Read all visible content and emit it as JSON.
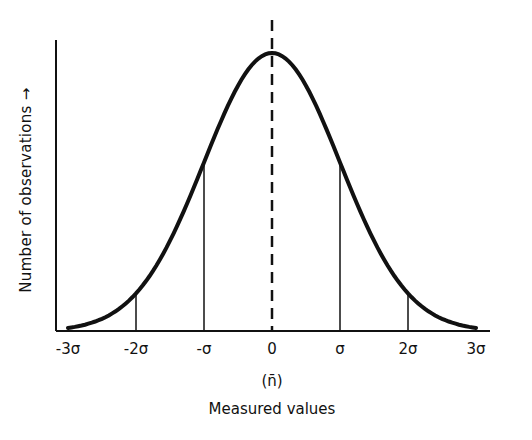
{
  "chart_data": {
    "type": "line",
    "title": "",
    "xlabel": "Measured values",
    "ylabel": "Number of observations →",
    "mean_label": "(n̄)",
    "x_ticks": [
      "-3σ",
      "-2σ",
      "-σ",
      "0",
      "σ",
      "2σ",
      "3σ"
    ],
    "x": [
      -3,
      -2.5,
      -2,
      -1.5,
      -1,
      -0.5,
      0,
      0.5,
      1,
      1.5,
      2,
      2.5,
      3
    ],
    "values": [
      0.011,
      0.044,
      0.135,
      0.325,
      0.607,
      0.882,
      1.0,
      0.882,
      0.607,
      0.325,
      0.135,
      0.044,
      0.011
    ],
    "series": [
      {
        "name": "Normal distribution",
        "values": [
          0.011,
          0.044,
          0.135,
          0.325,
          0.607,
          0.882,
          1.0,
          0.882,
          0.607,
          0.325,
          0.135,
          0.044,
          0.011
        ]
      }
    ],
    "vertical_lines": [
      {
        "x": -2,
        "style": "solid"
      },
      {
        "x": -1,
        "style": "solid"
      },
      {
        "x": 0,
        "style": "dashed"
      },
      {
        "x": 1,
        "style": "solid"
      },
      {
        "x": 2,
        "style": "solid"
      }
    ],
    "xlim": [
      -3.2,
      3.2
    ],
    "grid": false,
    "legend": "none"
  }
}
